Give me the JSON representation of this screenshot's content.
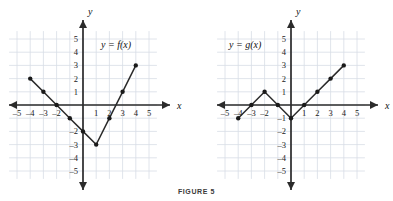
{
  "figure": {
    "caption": "FIGURE 5"
  },
  "panels": [
    {
      "id": "left",
      "function_label": "y = f(x)",
      "axis_x_label": "x",
      "axis_y_label": "y",
      "x_ticks": [
        "-5",
        "-4",
        "-3",
        "-2",
        "1",
        "2",
        "3",
        "4",
        "5"
      ],
      "y_ticks": [
        "5",
        "4",
        "3",
        "2",
        "1",
        "-2",
        "-3",
        "-4",
        "-5"
      ]
    },
    {
      "id": "right",
      "function_label": "y = g(x)",
      "axis_x_label": "x",
      "axis_y_label": "y",
      "x_ticks": [
        "-5",
        "-4",
        "-3",
        "-2",
        "1",
        "2",
        "3",
        "4",
        "5"
      ],
      "y_ticks": [
        "5",
        "4",
        "3",
        "2",
        "1",
        "-1",
        "-2",
        "-3",
        "-4",
        "-5"
      ]
    }
  ],
  "colors": {
    "grid": "#d8dde6",
    "axis": "#2b2b2b",
    "curve": "#2b2b2b",
    "marker": "#1a1a1a",
    "background": "#ffffff"
  },
  "chart_data": [
    {
      "type": "line",
      "title": "y = f(x)",
      "xlabel": "x",
      "ylabel": "y",
      "xlim": [
        -5.8,
        5.8
      ],
      "ylim": [
        -5.8,
        5.8
      ],
      "grid": true,
      "legend": "none",
      "annotations": [
        "y = f(x)"
      ],
      "x": [
        -4,
        -3,
        -2,
        -1,
        0,
        1,
        2,
        3,
        4
      ],
      "y": [
        2,
        1,
        0,
        -1,
        -2,
        -3,
        -1,
        1,
        3
      ],
      "markers": true,
      "xticks": [
        -5,
        -4,
        -3,
        -2,
        -1,
        1,
        2,
        3,
        4,
        5
      ],
      "yticks": [
        -5,
        -4,
        -3,
        -2,
        -1,
        1,
        2,
        3,
        4,
        5
      ],
      "xtick_labels_shown": [
        "-5",
        "-4",
        "-3",
        "-2",
        "1",
        "2",
        "3",
        "4",
        "5"
      ],
      "ytick_labels_shown": [
        "5",
        "4",
        "3",
        "2",
        "1",
        "-2",
        "-3",
        "-4",
        "-5"
      ]
    },
    {
      "type": "line",
      "title": "y = g(x)",
      "xlabel": "x",
      "ylabel": "y",
      "xlim": [
        -5.8,
        5.8
      ],
      "ylim": [
        -5.8,
        5.8
      ],
      "grid": true,
      "legend": "none",
      "annotations": [
        "y = g(x)"
      ],
      "x": [
        -4,
        -3,
        -2,
        -1,
        0,
        1,
        2,
        3,
        4
      ],
      "y": [
        -1,
        0,
        1,
        0,
        -1,
        0,
        1,
        2,
        3
      ],
      "markers": true,
      "xticks": [
        -5,
        -4,
        -3,
        -2,
        -1,
        1,
        2,
        3,
        4,
        5
      ],
      "yticks": [
        -5,
        -4,
        -3,
        -2,
        -1,
        1,
        2,
        3,
        4,
        5
      ],
      "xtick_labels_shown": [
        "-5",
        "-4",
        "-3",
        "-2",
        "1",
        "2",
        "3",
        "4",
        "5"
      ],
      "ytick_labels_shown": [
        "5",
        "4",
        "3",
        "2",
        "1",
        "-1",
        "-2",
        "-3",
        "-4",
        "-5"
      ]
    }
  ]
}
